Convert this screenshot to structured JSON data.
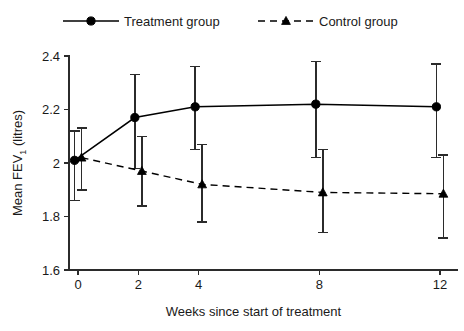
{
  "chart_data": {
    "type": "line",
    "title": "",
    "xlabel": "Weeks since start of treatment",
    "ylabel": "Mean FEV1 (litres)",
    "ylabel_base": "Mean FEV",
    "ylabel_sub": "1",
    "ylabel_tail": " (litres)",
    "x": [
      0,
      2,
      4,
      8,
      12
    ],
    "xticklabels": [
      "0",
      "2",
      "4",
      "8",
      "12"
    ],
    "yticks": [
      1.6,
      1.8,
      2.0,
      2.2,
      2.4
    ],
    "yticklabels": [
      "1.6",
      "1.8",
      "2",
      "2.2",
      "2.4"
    ],
    "xlim": [
      -0.3,
      12.6
    ],
    "ylim": [
      1.6,
      2.4
    ],
    "grid": false,
    "legend_position": "above-plot",
    "series": [
      {
        "name": "Treatment group",
        "marker": "circle",
        "linestyle": "solid",
        "color": "#000000",
        "values": [
          2.01,
          2.17,
          2.21,
          2.22,
          2.21
        ],
        "error_low": [
          1.86,
          1.98,
          2.05,
          2.02,
          2.02
        ],
        "error_high": [
          2.12,
          2.33,
          2.36,
          2.38,
          2.37
        ]
      },
      {
        "name": "Control group",
        "marker": "triangle",
        "linestyle": "dashed",
        "color": "#000000",
        "values": [
          2.02,
          1.97,
          1.92,
          1.89,
          1.885
        ],
        "error_low": [
          1.9,
          1.84,
          1.78,
          1.74,
          1.72
        ],
        "error_high": [
          2.13,
          2.1,
          2.07,
          2.05,
          2.03
        ]
      }
    ]
  },
  "legend": {
    "items": [
      {
        "label": "Treatment group",
        "marker": "circle",
        "linestyle": "solid"
      },
      {
        "label": "Control group",
        "marker": "triangle",
        "linestyle": "dashed"
      }
    ]
  }
}
